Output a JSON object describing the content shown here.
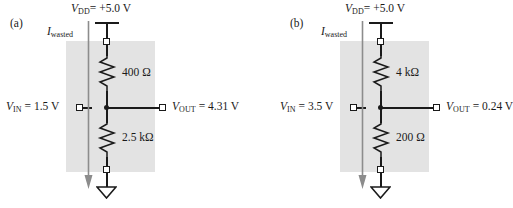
{
  "figure": {
    "type": "circuit-schematic"
  },
  "panels": [
    {
      "key": "a",
      "label": "(a)",
      "supply": {
        "symbol": "V",
        "subscript": "DD",
        "relation": "=",
        "value": "+5.0 V",
        "full": "VDD = +5.0 V"
      },
      "current": {
        "symbol": "I",
        "subscript": "wasted",
        "full": "Iwasted",
        "direction": "down"
      },
      "resistor_top": {
        "value": "400",
        "unit": "Ω",
        "full": "400 Ω"
      },
      "resistor_bottom": {
        "value": "2.5",
        "unit": "kΩ",
        "full": "2.5 kΩ"
      },
      "input": {
        "symbol": "V",
        "subscript": "IN",
        "relation": "=",
        "value": "1.5 V",
        "full": "VIN = 1.5 V"
      },
      "output": {
        "symbol": "V",
        "subscript": "OUT",
        "relation": "=",
        "value": "4.31 V",
        "full": "VOUT = 4.31 V"
      },
      "ground": "ground-symbol"
    },
    {
      "key": "b",
      "label": "(b)",
      "supply": {
        "symbol": "V",
        "subscript": "DD",
        "relation": "=",
        "value": "+5.0 V",
        "full": "VDD = +5.0 V"
      },
      "current": {
        "symbol": "I",
        "subscript": "wasted",
        "full": "Iwasted",
        "direction": "down"
      },
      "resistor_top": {
        "value": "4",
        "unit": "kΩ",
        "full": "4 kΩ"
      },
      "resistor_bottom": {
        "value": "200",
        "unit": "Ω",
        "full": "200 Ω"
      },
      "input": {
        "symbol": "V",
        "subscript": "IN",
        "relation": "=",
        "value": "3.5 V",
        "full": "VIN = 3.5 V"
      },
      "output": {
        "symbol": "V",
        "subscript": "OUT",
        "relation": "=",
        "value": "0.24 V",
        "full": "VOUT = 0.24 V"
      },
      "ground": "ground-symbol"
    }
  ],
  "colors": {
    "ink": "#1a1a1a",
    "shade": "#e3e3e3",
    "current_arrow": "#8c8c8c",
    "background": "#ffffff"
  }
}
